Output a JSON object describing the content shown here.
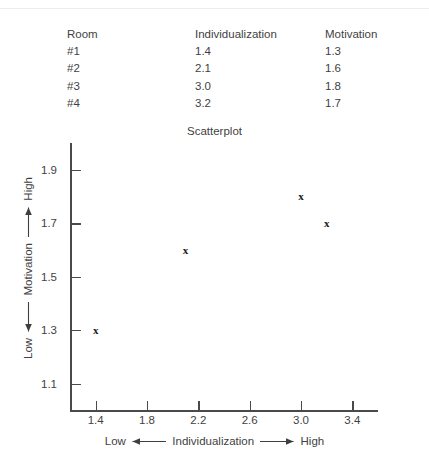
{
  "table": {
    "headers": [
      "Room",
      "Individualization",
      "Motivation"
    ],
    "rows": [
      [
        "#1",
        "1.4",
        "1.3"
      ],
      [
        "#2",
        "2.1",
        "1.6"
      ],
      [
        "#3",
        "3.0",
        "1.8"
      ],
      [
        "#4",
        "3.2",
        "1.7"
      ]
    ]
  },
  "chart_data": {
    "type": "scatter",
    "title": "Scatterplot",
    "xlabel": "Low ◄— Individualization —► High",
    "ylabel": "Low ◄— Motivation —► High",
    "xlabel_parts": {
      "low": "Low",
      "name": "Individualization",
      "high": "High"
    },
    "ylabel_parts": {
      "low": "Low",
      "name": "Motivation",
      "high": "High"
    },
    "x": [
      1.4,
      2.1,
      3.0,
      3.2
    ],
    "y": [
      1.3,
      1.6,
      1.8,
      1.7
    ],
    "point_labels": [
      "#1",
      "#2",
      "#3",
      "#4"
    ],
    "marker": "x",
    "xlim": [
      1.2,
      3.6
    ],
    "ylim": [
      1.0,
      2.0
    ],
    "xticks": [
      1.4,
      1.8,
      2.2,
      2.6,
      3.0,
      3.4
    ],
    "yticks": [
      1.1,
      1.3,
      1.5,
      1.7,
      1.9
    ],
    "xtick_labels": [
      "1.4",
      "1.8",
      "2.2",
      "2.6",
      "3.0",
      "3.4"
    ],
    "ytick_labels": [
      "1.1",
      "1.3",
      "1.5",
      "1.7",
      "1.9"
    ],
    "grid": false,
    "legend": null,
    "axis_color": "#4a4a4a",
    "text_color": "#3f3f3f",
    "marker_color": "#1a1a1a"
  }
}
